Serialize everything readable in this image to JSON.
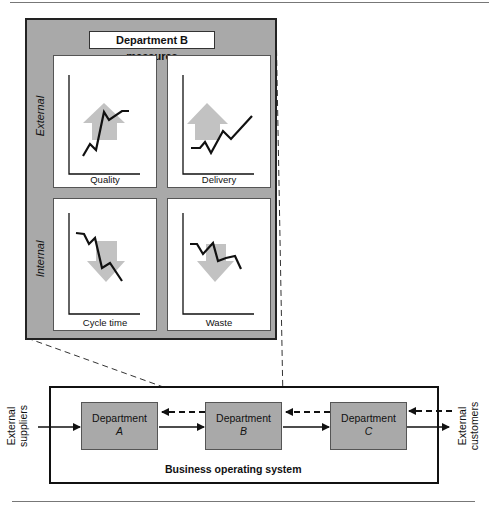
{
  "panel": {
    "title": "Department B measures",
    "row_labels": {
      "external": "External",
      "internal": "Internal"
    },
    "cards": [
      {
        "label": "Quality",
        "trend": "up"
      },
      {
        "label": "Delivery",
        "trend": "up"
      },
      {
        "label": "Cycle time",
        "trend": "down"
      },
      {
        "label": "Waste",
        "trend": "down"
      }
    ]
  },
  "system": {
    "label": "Business operating system",
    "departments": [
      {
        "name": "Department",
        "letter": "A"
      },
      {
        "name": "Department",
        "letter": "B"
      },
      {
        "name": "Department",
        "letter": "C"
      }
    ],
    "inputs_label": "External suppliers",
    "outputs_label": "External customers"
  },
  "colors": {
    "panel_fill": "#a9a9a9",
    "arrow_fill": "#c2c2c2",
    "line": "#111111"
  }
}
